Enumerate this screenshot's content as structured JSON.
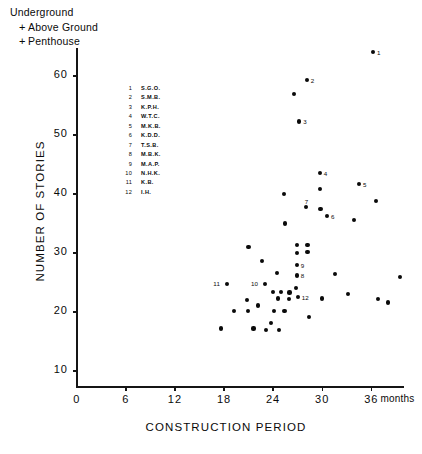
{
  "legend": {
    "items": [
      {
        "marker": "",
        "label": "Underground"
      },
      {
        "marker": "+",
        "label": "Above Ground"
      },
      {
        "marker": "+",
        "label": "Penthouse"
      }
    ]
  },
  "building_key": [
    {
      "num": "1",
      "name": "S.G.O."
    },
    {
      "num": "2",
      "name": "S.M.B."
    },
    {
      "num": "3",
      "name": "K.P.H."
    },
    {
      "num": "4",
      "name": "W.T.C."
    },
    {
      "num": "5",
      "name": "M.K.B."
    },
    {
      "num": "6",
      "name": "K.D.D."
    },
    {
      "num": "7",
      "name": "T.S.B."
    },
    {
      "num": "8",
      "name": "M.B.K."
    },
    {
      "num": "9",
      "name": "M.A.P."
    },
    {
      "num": "10",
      "name": "N.H.K."
    },
    {
      "num": "11",
      "name": "K.B."
    },
    {
      "num": "12",
      "name": "I.H."
    }
  ],
  "chart_data": {
    "type": "scatter",
    "title": "",
    "xlabel": "CONSTRUCTION PERIOD",
    "ylabel": "NUMBER OF STORIES",
    "xunit": "months",
    "xlim": [
      0,
      40
    ],
    "ylim": [
      0,
      66
    ],
    "xticks": [
      0,
      6,
      12,
      18,
      24,
      30,
      36
    ],
    "xticklabels": [
      "0",
      "6",
      "12",
      "18",
      "24",
      "30",
      "36"
    ],
    "yticks": [
      10,
      20,
      30,
      40,
      50,
      60
    ],
    "yticklabels": [
      "10",
      "20",
      "30",
      "40",
      "50",
      "60"
    ],
    "grid": false,
    "legend_position": "top-left",
    "points": [
      {
        "x": 36.2,
        "y": 64.0,
        "label": "1"
      },
      {
        "x": 28.1,
        "y": 59.3,
        "label": "2"
      },
      {
        "x": 26.6,
        "y": 57.0,
        "label": ""
      },
      {
        "x": 27.2,
        "y": 52.3,
        "label": "3"
      },
      {
        "x": 29.7,
        "y": 43.6,
        "label": "4"
      },
      {
        "x": 29.7,
        "y": 40.8,
        "label": ""
      },
      {
        "x": 34.5,
        "y": 41.7,
        "label": "5"
      },
      {
        "x": 28.0,
        "y": 37.8,
        "label": "7"
      },
      {
        "x": 29.8,
        "y": 37.5,
        "label": ""
      },
      {
        "x": 30.6,
        "y": 36.3,
        "label": "6"
      },
      {
        "x": 25.3,
        "y": 40.0,
        "label": ""
      },
      {
        "x": 25.5,
        "y": 35.0,
        "label": ""
      },
      {
        "x": 36.6,
        "y": 38.8,
        "label": ""
      },
      {
        "x": 33.9,
        "y": 35.6,
        "label": ""
      },
      {
        "x": 21.0,
        "y": 31.0,
        "label": ""
      },
      {
        "x": 22.6,
        "y": 28.6,
        "label": ""
      },
      {
        "x": 26.9,
        "y": 31.3,
        "label": ""
      },
      {
        "x": 28.2,
        "y": 31.3,
        "label": ""
      },
      {
        "x": 26.9,
        "y": 30.0,
        "label": ""
      },
      {
        "x": 28.2,
        "y": 30.1,
        "label": ""
      },
      {
        "x": 26.9,
        "y": 28.0,
        "label": "9"
      },
      {
        "x": 26.9,
        "y": 26.2,
        "label": "8"
      },
      {
        "x": 24.5,
        "y": 26.6,
        "label": ""
      },
      {
        "x": 23.0,
        "y": 24.8,
        "label": "10"
      },
      {
        "x": 26.8,
        "y": 24.0,
        "label": ""
      },
      {
        "x": 18.4,
        "y": 24.8,
        "label": "11"
      },
      {
        "x": 24.0,
        "y": 23.4,
        "label": ""
      },
      {
        "x": 25.0,
        "y": 23.4,
        "label": ""
      },
      {
        "x": 26.0,
        "y": 23.3,
        "label": ""
      },
      {
        "x": 24.6,
        "y": 22.3,
        "label": ""
      },
      {
        "x": 25.9,
        "y": 22.2,
        "label": ""
      },
      {
        "x": 27.0,
        "y": 22.6,
        "label": "12"
      },
      {
        "x": 20.8,
        "y": 22.1,
        "label": ""
      },
      {
        "x": 22.2,
        "y": 21.1,
        "label": ""
      },
      {
        "x": 19.2,
        "y": 20.2,
        "label": ""
      },
      {
        "x": 20.9,
        "y": 20.2,
        "label": ""
      },
      {
        "x": 24.1,
        "y": 20.1,
        "label": ""
      },
      {
        "x": 25.4,
        "y": 20.1,
        "label": ""
      },
      {
        "x": 23.7,
        "y": 18.2,
        "label": ""
      },
      {
        "x": 21.6,
        "y": 17.2,
        "label": ""
      },
      {
        "x": 23.1,
        "y": 17.0,
        "label": ""
      },
      {
        "x": 24.7,
        "y": 17.0,
        "label": ""
      },
      {
        "x": 17.6,
        "y": 17.2,
        "label": ""
      },
      {
        "x": 30.0,
        "y": 22.3,
        "label": ""
      },
      {
        "x": 31.6,
        "y": 26.5,
        "label": ""
      },
      {
        "x": 33.2,
        "y": 23.0,
        "label": ""
      },
      {
        "x": 36.8,
        "y": 22.2,
        "label": ""
      },
      {
        "x": 38.0,
        "y": 21.6,
        "label": ""
      },
      {
        "x": 39.5,
        "y": 25.9,
        "label": ""
      },
      {
        "x": 28.4,
        "y": 19.2,
        "label": ""
      }
    ]
  }
}
